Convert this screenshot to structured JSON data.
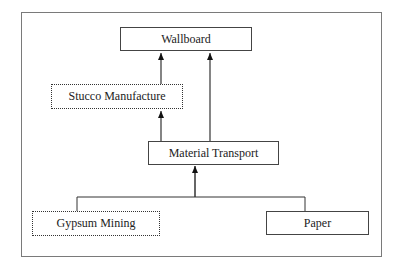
{
  "diagram": {
    "nodes": [
      {
        "id": "wallboard",
        "label": "Wallboard",
        "style": "solid"
      },
      {
        "id": "stucco",
        "label": "Stucco Manufacture",
        "style": "dotted"
      },
      {
        "id": "transport",
        "label": "Material Transport",
        "style": "solid"
      },
      {
        "id": "gypsum",
        "label": "Gypsum Mining",
        "style": "dotted"
      },
      {
        "id": "paper",
        "label": "Paper",
        "style": "solid"
      }
    ],
    "edges": [
      {
        "from": "stucco",
        "to": "wallboard"
      },
      {
        "from": "transport",
        "to": "wallboard"
      },
      {
        "from": "transport",
        "to": "stucco"
      },
      {
        "from": "gypsum",
        "to": "transport"
      },
      {
        "from": "paper",
        "to": "transport"
      }
    ]
  }
}
